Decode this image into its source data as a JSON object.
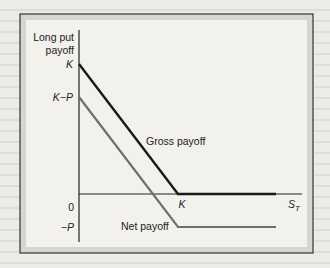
{
  "chart_data": {
    "type": "line",
    "title": "",
    "ylabel": "Long put payoff",
    "xlabel": "S_T",
    "x_ticks": [
      {
        "label": "K",
        "value": "K"
      }
    ],
    "y_ticks": [
      {
        "label": "K",
        "value": "K"
      },
      {
        "label": "K−P",
        "value": "K-P"
      },
      {
        "label": "0",
        "value": "0"
      },
      {
        "label": "−P",
        "value": "-P"
      }
    ],
    "series": [
      {
        "name": "Gross payoff",
        "color": "#1a1a1a",
        "points": [
          {
            "x": "0",
            "y": "K"
          },
          {
            "x": "K",
            "y": "0"
          },
          {
            "x": "beyond K",
            "y": "0"
          }
        ]
      },
      {
        "name": "Net payoff",
        "color": "#6e6e6e",
        "points": [
          {
            "x": "0",
            "y": "K-P"
          },
          {
            "x": "K",
            "y": "-P"
          },
          {
            "x": "beyond K",
            "y": "-P"
          }
        ]
      }
    ],
    "annotations": [
      "Gross payoff",
      "Net payoff"
    ],
    "grid": false,
    "legend": "none (inline labels)"
  },
  "labels": {
    "ylabel_line1": "Long put",
    "ylabel_line2": "payoff",
    "xlabel_main": "S",
    "xlabel_sub": "T",
    "tick_K_y": "K",
    "tick_KmP": "K−P",
    "tick_zero": "0",
    "tick_mP": "−P",
    "tick_K_x": "K",
    "gross": "Gross payoff",
    "net": "Net payoff"
  }
}
